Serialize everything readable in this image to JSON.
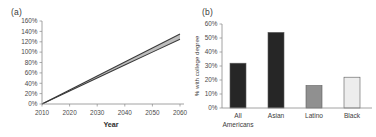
{
  "figure": {
    "panels": [
      {
        "id": "a",
        "label": "(a)"
      },
      {
        "id": "b",
        "label": "(b)"
      }
    ]
  },
  "chart_data": [
    {
      "type": "line",
      "panel": "(a)",
      "title": "",
      "xlabel": "Year",
      "ylabel": "",
      "xlim": [
        2010,
        2060
      ],
      "ylim": [
        0,
        160
      ],
      "grid": false,
      "legend": "none",
      "xticks": [
        "2010",
        "2020",
        "2030",
        "2040",
        "2050",
        "2060"
      ],
      "xtick_values": [
        2010,
        2020,
        2030,
        2040,
        2050,
        2060
      ],
      "yticks": [
        "0%",
        "20%",
        "40%",
        "60%",
        "80%",
        "100%",
        "120%",
        "140%",
        "160%"
      ],
      "ytick_values": [
        0,
        20,
        40,
        60,
        80,
        100,
        120,
        140,
        160
      ],
      "x": [
        2010,
        2020,
        2030,
        2040,
        2050,
        2060
      ],
      "series": [
        {
          "name": "upper",
          "color": "#3a3a3a",
          "values": [
            0,
            27,
            54,
            81,
            108,
            135
          ]
        },
        {
          "name": "lower",
          "color": "#3a3a3a",
          "values": [
            0,
            25,
            50,
            75,
            100,
            125
          ]
        }
      ],
      "band": {
        "name": "uncertainty-band",
        "color": "#b9b9b9",
        "upper": [
          0,
          27,
          54,
          81,
          108,
          135
        ],
        "lower": [
          0,
          25,
          50,
          75,
          100,
          125
        ]
      }
    },
    {
      "type": "bar",
      "panel": "(b)",
      "title": "",
      "xlabel": "",
      "ylabel": "% with college degree",
      "ylim": [
        0,
        60
      ],
      "grid": false,
      "legend": "none",
      "yticks": [
        "0%",
        "10%",
        "20%",
        "30%",
        "40%",
        "50%",
        "60%"
      ],
      "ytick_values": [
        0,
        10,
        20,
        30,
        40,
        50,
        60
      ],
      "categories": [
        "All Americans",
        "Asian",
        "Latino",
        "Black"
      ],
      "category_lines": [
        [
          "All",
          "Americans"
        ],
        [
          "Asian"
        ],
        [
          "Latino"
        ],
        [
          "Black"
        ]
      ],
      "values": [
        32,
        54,
        16,
        22
      ],
      "bar_colors": [
        "#262626",
        "#262626",
        "#909090",
        "#ededed"
      ],
      "bar_edge_color": "#5a5a5a"
    }
  ]
}
